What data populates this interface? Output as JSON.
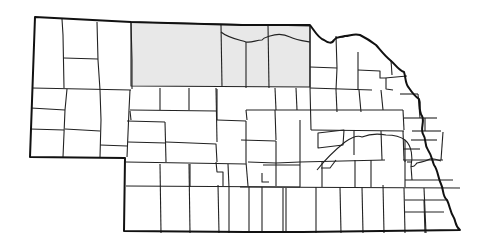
{
  "map": {
    "title": "Nebraska counties",
    "colors": {
      "background": "#ffffff",
      "unshaded_fill": "#ffffff",
      "shaded_fill": "#e8e8e8",
      "border": "#111111"
    },
    "shaded_region": {
      "description": "North-central Nebraska counties (Sheridan-adjacent north tier: Cherry, Keya Paha, Brown, Rock)",
      "counties": [
        "Cherry",
        "Keya Paha",
        "Brown",
        "Rock"
      ]
    }
  }
}
